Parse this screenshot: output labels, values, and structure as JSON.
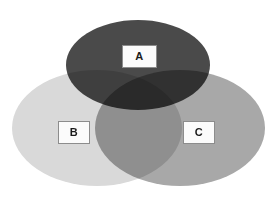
{
  "diagram": {
    "type": "venn",
    "title": "",
    "canvas": {
      "width": 276,
      "height": 197,
      "background": "#ffffff"
    },
    "sets": [
      {
        "id": "A",
        "label": "A",
        "color": "#4a4a4a",
        "position": "top",
        "center": {
          "x": 138,
          "y": 65
        },
        "radius": {
          "rx": 72,
          "ry": 45
        }
      },
      {
        "id": "B",
        "label": "B",
        "color": "#d9d9d9",
        "position": "bottom-left",
        "center": {
          "x": 97,
          "y": 128
        },
        "radius": {
          "rx": 85,
          "ry": 58
        }
      },
      {
        "id": "C",
        "label": "C",
        "color": "#a8a8a8",
        "position": "bottom-right",
        "center": {
          "x": 180,
          "y": 128
        },
        "radius": {
          "rx": 85,
          "ry": 58
        }
      }
    ],
    "regions": [
      {
        "id": "A-only",
        "sets": [
          "A"
        ],
        "color": "#4a4a4a"
      },
      {
        "id": "B-only",
        "sets": [
          "B"
        ],
        "color": "#d9d9d9"
      },
      {
        "id": "C-only",
        "sets": [
          "C"
        ],
        "color": "#a8a8a8"
      },
      {
        "id": "A-and-B",
        "sets": [
          "A",
          "B"
        ],
        "color": "#a0a0a0"
      },
      {
        "id": "A-and-C",
        "sets": [
          "A",
          "C"
        ],
        "color": "#7a7a7a"
      },
      {
        "id": "B-and-C",
        "sets": [
          "B",
          "C"
        ],
        "color": "#969696"
      },
      {
        "id": "A-B-C",
        "sets": [
          "A",
          "B",
          "C"
        ],
        "color": "#6e6e6e"
      }
    ],
    "labels": {
      "a": "A",
      "b": "B",
      "c": "C"
    },
    "label_style": {
      "background": "#fbfbfb",
      "border_color": "#8c8c8c",
      "text_color": "#1a1a1a"
    }
  }
}
